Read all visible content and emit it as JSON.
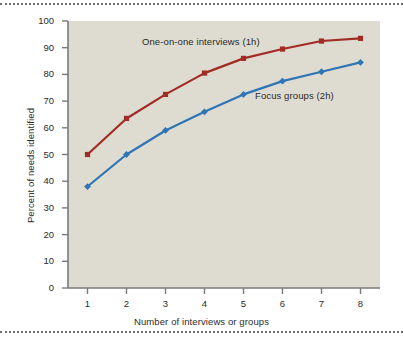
{
  "figure": {
    "background_color": "#ffffff",
    "plot_background_color": "#dedcd0",
    "rule_color": "#6b6b6b"
  },
  "chart_data": {
    "type": "line",
    "title": "",
    "xlabel": "Number of interviews or groups",
    "ylabel": "Percent of needs identified",
    "x": [
      1,
      2,
      3,
      4,
      5,
      6,
      7,
      8
    ],
    "xtick_labels": [
      "1",
      "2",
      "3",
      "4",
      "5",
      "6",
      "7",
      "8"
    ],
    "ytick_labels": [
      "0",
      "10",
      "20",
      "30",
      "40",
      "50",
      "60",
      "70",
      "80",
      "90",
      "100"
    ],
    "yticks": [
      0,
      10,
      20,
      30,
      40,
      50,
      60,
      70,
      80,
      90,
      100
    ],
    "xlim": [
      0.5,
      8.5
    ],
    "ylim": [
      0,
      100
    ],
    "grid": false,
    "legend_position": "inline-annotations",
    "series": [
      {
        "name": "One-on-one interviews (1h)",
        "color": "#a32b25",
        "marker": "square",
        "values": [
          50,
          63.5,
          72.5,
          80.5,
          86,
          89.5,
          92.5,
          93.5
        ],
        "annotation": {
          "text": "One-on-one interviews (1h)",
          "x": 142,
          "y": 36
        }
      },
      {
        "name": "Focus groups (2h)",
        "color": "#2f74b5",
        "marker": "diamond",
        "values": [
          38,
          50,
          59,
          66,
          72.5,
          77.5,
          81,
          84.5
        ],
        "annotation": {
          "text": "Focus groups (2h)",
          "x": 255,
          "y": 90
        }
      }
    ]
  }
}
